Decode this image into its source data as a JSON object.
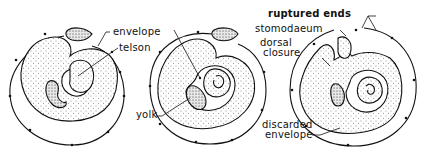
{
  "figure": {
    "panels": [
      {
        "id": "stage-1",
        "labels": [
          {
            "key": "envelope",
            "text": "envelope"
          },
          {
            "key": "telson",
            "text": "telson"
          }
        ]
      },
      {
        "id": "stage-2",
        "labels": [
          {
            "key": "yolk",
            "text": "yolk"
          }
        ]
      },
      {
        "id": "stage-3",
        "labels": [
          {
            "key": "ruptured_ends",
            "text": "ruptured ends"
          },
          {
            "key": "stomodaeum",
            "text": "stomodaeum"
          },
          {
            "key": "dorsal_closure_line1",
            "text": "dorsal"
          },
          {
            "key": "dorsal_closure_line2",
            "text": "closure"
          },
          {
            "key": "discarded_envelope_line1",
            "text": "discarded"
          },
          {
            "key": "discarded_envelope_line2",
            "text": "envelope"
          }
        ]
      }
    ],
    "colors": {
      "ink": "#111111",
      "background": "#ffffff"
    }
  }
}
